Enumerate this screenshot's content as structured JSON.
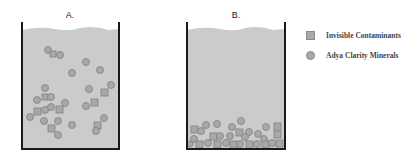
{
  "panels": [
    {
      "label": "A.",
      "state": "suspended"
    },
    {
      "label": "B.",
      "state": "settled"
    }
  ],
  "legend": [
    {
      "shape": "square",
      "label": "Invisible Contaminants"
    },
    {
      "shape": "circle",
      "label": "Adya Clarity Minerals"
    }
  ],
  "colors": {
    "water": "#cbcbcb",
    "particle_fill": "#a8a8a8",
    "particle_stroke": "#808080",
    "wall": "#1a1a1a"
  }
}
